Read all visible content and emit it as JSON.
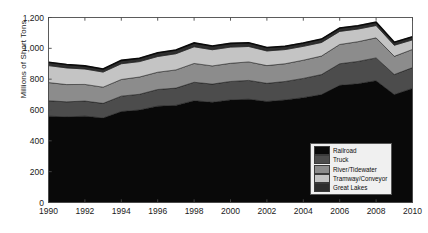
{
  "chart_data": {
    "type": "area",
    "title": "",
    "subtitle": "",
    "xlabel": "",
    "ylabel": "Millions of Short Tons",
    "stacked": true,
    "grid": false,
    "legend_position": "bottom-right-inside",
    "xlim": [
      1990,
      2010
    ],
    "ylim": [
      0,
      1200
    ],
    "ytick_labels": [
      "0",
      "200",
      "400",
      "600",
      "800",
      "1,000",
      "1,200"
    ],
    "ytick_values": [
      0,
      200,
      400,
      600,
      800,
      1000,
      1200
    ],
    "xtick_labels": [
      "1990",
      "1992",
      "1994",
      "1996",
      "1998",
      "2000",
      "2002",
      "2004",
      "2006",
      "2008",
      "2010"
    ],
    "xtick_values": [
      1990,
      1992,
      1994,
      1996,
      1998,
      2000,
      2002,
      2004,
      2006,
      2008,
      2010
    ],
    "x": [
      1990,
      1991,
      1992,
      1993,
      1994,
      1995,
      1996,
      1997,
      1998,
      1999,
      2000,
      2001,
      2002,
      2003,
      2004,
      2005,
      2006,
      2007,
      2008,
      2009,
      2010
    ],
    "series": [
      {
        "name": "Railroad",
        "color": "#090909",
        "values": [
          560,
          555,
          560,
          548,
          590,
          600,
          625,
          630,
          660,
          650,
          665,
          670,
          655,
          665,
          680,
          700,
          760,
          770,
          790,
          700,
          740
        ]
      },
      {
        "name": "Truck",
        "color": "#4c4c4c",
        "values": [
          100,
          98,
          98,
          95,
          100,
          102,
          108,
          112,
          120,
          118,
          120,
          122,
          118,
          120,
          125,
          130,
          140,
          145,
          148,
          130,
          135
        ]
      },
      {
        "name": "River/Tidewater",
        "color": "#8c8c8c",
        "values": [
          118,
          112,
          108,
          105,
          108,
          112,
          112,
          118,
          122,
          118,
          118,
          120,
          115,
          115,
          118,
          120,
          125,
          128,
          130,
          118,
          118
        ]
      },
      {
        "name": "Tramway/Conveyor",
        "color": "#c4c4c4",
        "values": [
          110,
          108,
          100,
          98,
          102,
          100,
          102,
          105,
          108,
          105,
          105,
          100,
          95,
          92,
          90,
          88,
          85,
          82,
          80,
          72,
          62
        ]
      },
      {
        "name": "Great Lakes",
        "color": "#2e2e2e",
        "values": [
          22,
          22,
          20,
          20,
          22,
          22,
          24,
          24,
          25,
          24,
          24,
          24,
          22,
          22,
          22,
          22,
          22,
          22,
          22,
          20,
          20
        ]
      }
    ]
  },
  "legend": {
    "items": [
      {
        "label": "Railroad"
      },
      {
        "label": "Truck"
      },
      {
        "label": "River/Tidewater"
      },
      {
        "label": "Tramway/Conveyor"
      },
      {
        "label": "Great Lakes"
      }
    ]
  },
  "axes": {
    "y_axis_label": "Millions of Short Tons"
  }
}
